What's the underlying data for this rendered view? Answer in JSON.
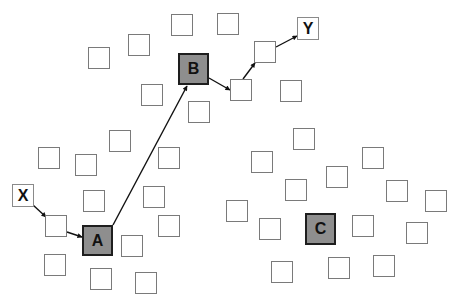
{
  "diagram": {
    "colors": {
      "hub_fill": "#8e8e8e",
      "hub_border": "#1e1e1e",
      "node_border": "#7a7a7a",
      "edge": "#111111",
      "background": "#ffffff"
    },
    "labeled_nodes": [
      {
        "id": "X",
        "label": "X",
        "type": "endpoint",
        "x": 12,
        "y": 184,
        "w": 22,
        "h": 23
      },
      {
        "id": "Y",
        "label": "Y",
        "type": "endpoint",
        "x": 297,
        "y": 17,
        "w": 22,
        "h": 23
      },
      {
        "id": "A",
        "label": "A",
        "type": "hub",
        "x": 82,
        "y": 225,
        "w": 31,
        "h": 31
      },
      {
        "id": "B",
        "label": "B",
        "type": "hub",
        "x": 178,
        "y": 53,
        "w": 31,
        "h": 32
      },
      {
        "id": "C",
        "label": "C",
        "type": "hub",
        "x": 305,
        "y": 213,
        "w": 31,
        "h": 32
      }
    ],
    "nodes": [
      {
        "x": 88,
        "y": 47
      },
      {
        "x": 128,
        "y": 34
      },
      {
        "x": 171,
        "y": 14
      },
      {
        "x": 217,
        "y": 13
      },
      {
        "x": 141,
        "y": 84
      },
      {
        "x": 188,
        "y": 101
      },
      {
        "x": 109,
        "y": 130
      },
      {
        "x": 38,
        "y": 147
      },
      {
        "x": 158,
        "y": 147
      },
      {
        "x": 254,
        "y": 41
      },
      {
        "x": 230,
        "y": 79
      },
      {
        "x": 280,
        "y": 80
      },
      {
        "x": 293,
        "y": 128
      },
      {
        "x": 362,
        "y": 147
      },
      {
        "x": 251,
        "y": 151
      },
      {
        "x": 75,
        "y": 154
      },
      {
        "x": 83,
        "y": 190
      },
      {
        "x": 143,
        "y": 186
      },
      {
        "x": 45,
        "y": 215
      },
      {
        "x": 158,
        "y": 215
      },
      {
        "x": 121,
        "y": 235
      },
      {
        "x": 44,
        "y": 254
      },
      {
        "x": 90,
        "y": 268
      },
      {
        "x": 135,
        "y": 272
      },
      {
        "x": 285,
        "y": 179
      },
      {
        "x": 326,
        "y": 166
      },
      {
        "x": 386,
        "y": 180
      },
      {
        "x": 425,
        "y": 190
      },
      {
        "x": 226,
        "y": 200
      },
      {
        "x": 259,
        "y": 218
      },
      {
        "x": 352,
        "y": 215
      },
      {
        "x": 406,
        "y": 222
      },
      {
        "x": 271,
        "y": 261
      },
      {
        "x": 328,
        "y": 257
      },
      {
        "x": 373,
        "y": 255
      }
    ],
    "node_size": 22,
    "edges": [
      {
        "from": "X",
        "to": "n(45,215)",
        "x1": 33,
        "y1": 205,
        "x2": 46,
        "y2": 217
      },
      {
        "from": "n(45,215)",
        "to": "A",
        "x1": 67,
        "y1": 232,
        "x2": 82,
        "y2": 237
      },
      {
        "from": "A",
        "to": "B",
        "x1": 113,
        "y1": 225,
        "x2": 187,
        "y2": 86
      },
      {
        "from": "B",
        "to": "n(230,79)",
        "x1": 209,
        "y1": 78,
        "x2": 230,
        "y2": 90
      },
      {
        "from": "n(230,79)",
        "to": "n(254,41)",
        "x1": 243,
        "y1": 79,
        "x2": 255,
        "y2": 63
      },
      {
        "from": "n(254,41)",
        "to": "Y",
        "x1": 276,
        "y1": 47,
        "x2": 297,
        "y2": 36
      }
    ]
  }
}
